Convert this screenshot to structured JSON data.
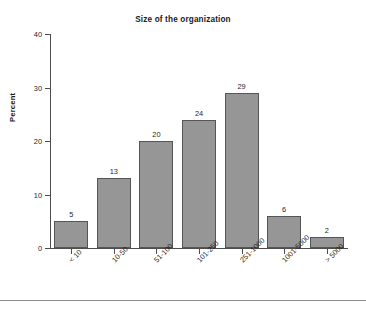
{
  "figure": {
    "background_color": "#ffffff",
    "bottom_rule_color": "#8c8c8c"
  },
  "chart_data": {
    "type": "bar",
    "title": "Size of the organization",
    "xlabel": "",
    "ylabel": "Percent",
    "categories": [
      "< 10",
      "10-50",
      "51-100",
      "101-250",
      "251-1000",
      "1001-5000",
      "> 5000"
    ],
    "values": [
      5,
      13,
      20,
      24,
      29,
      6,
      2
    ],
    "value_labels": [
      "5",
      "13",
      "20",
      "24",
      "29",
      "6",
      "2"
    ],
    "ylim": [
      0,
      40
    ],
    "yticks": [
      0,
      10,
      20,
      30,
      40
    ],
    "ytick_labels": [
      "0",
      "10",
      "20",
      "30",
      "40"
    ],
    "grid": false,
    "legend": null,
    "bar_fill_color": "#969696",
    "bar_edge_color": "#555555",
    "axis_color": "#4d4d4d"
  }
}
